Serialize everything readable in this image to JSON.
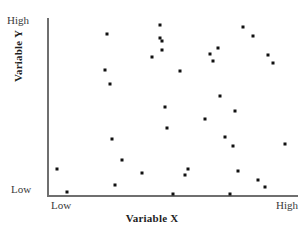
{
  "chart_data": {
    "type": "scatter",
    "title": "",
    "xlabel": "Variable X",
    "ylabel": "Variable Y",
    "xlim": [
      0,
      100
    ],
    "ylim": [
      0,
      100
    ],
    "xtick_labels": [
      "Low",
      "High"
    ],
    "ytick_labels": [
      "Low",
      "High"
    ],
    "grid": false,
    "legend": null,
    "marker": "square",
    "marker_color": "#111111",
    "axis_color": "#6f6f6f",
    "n_points": 40,
    "points": [
      {
        "x": 4,
        "y": 15
      },
      {
        "x": 8,
        "y": 2
      },
      {
        "x": 23,
        "y": 71
      },
      {
        "x": 24,
        "y": 91
      },
      {
        "x": 25,
        "y": 63
      },
      {
        "x": 26,
        "y": 32
      },
      {
        "x": 27,
        "y": 6
      },
      {
        "x": 30,
        "y": 20
      },
      {
        "x": 38,
        "y": 13
      },
      {
        "x": 42,
        "y": 78
      },
      {
        "x": 45,
        "y": 96
      },
      {
        "x": 45,
        "y": 89
      },
      {
        "x": 46,
        "y": 87
      },
      {
        "x": 46,
        "y": 82
      },
      {
        "x": 47,
        "y": 50
      },
      {
        "x": 48,
        "y": 38
      },
      {
        "x": 50,
        "y": 1
      },
      {
        "x": 53,
        "y": 70
      },
      {
        "x": 55,
        "y": 12
      },
      {
        "x": 56,
        "y": 15
      },
      {
        "x": 63,
        "y": 43
      },
      {
        "x": 65,
        "y": 80
      },
      {
        "x": 66,
        "y": 76
      },
      {
        "x": 68,
        "y": 83
      },
      {
        "x": 69,
        "y": 56
      },
      {
        "x": 71,
        "y": 33
      },
      {
        "x": 73,
        "y": 1
      },
      {
        "x": 74,
        "y": 28
      },
      {
        "x": 75,
        "y": 48
      },
      {
        "x": 76,
        "y": 14
      },
      {
        "x": 78,
        "y": 95
      },
      {
        "x": 82,
        "y": 90
      },
      {
        "x": 84,
        "y": 9
      },
      {
        "x": 87,
        "y": 5
      },
      {
        "x": 88,
        "y": 79
      },
      {
        "x": 90,
        "y": 75
      },
      {
        "x": 95,
        "y": 29
      }
    ]
  },
  "axes": {
    "y_top_label": "High",
    "y_bottom_label": "Low",
    "x_left_label": "Low",
    "x_right_label": "High",
    "x_title": "Variable X",
    "y_title": "Variable Y"
  }
}
